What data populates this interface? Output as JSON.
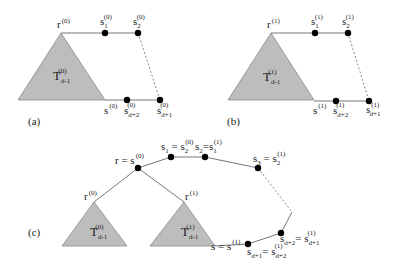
{
  "panels": {
    "a": {
      "label": "(a)",
      "root": {
        "base": "r",
        "sup": "(0)"
      },
      "tree": {
        "base": "T",
        "sup": "(0)",
        "sub": "d-1"
      },
      "s1": {
        "base": "s",
        "sub": "1",
        "sup": "(0)"
      },
      "s2": {
        "base": "s",
        "sub": "2",
        "sup": "(0)"
      },
      "s": {
        "base": "s",
        "sup": "(0)"
      },
      "sd2": {
        "base": "s",
        "sub": "d+2",
        "sup": "(0)"
      },
      "sd1": {
        "base": "s",
        "sub": "d+1",
        "sup": "(0)"
      }
    },
    "b": {
      "label": "(b)",
      "root": {
        "base": "r",
        "sup": "(1)"
      },
      "tree": {
        "base": "T",
        "sup": "(1)",
        "sub": "d-1"
      },
      "s1": {
        "base": "s",
        "sub": "1",
        "sup": "(1)"
      },
      "s2": {
        "base": "s",
        "sub": "2",
        "sup": "(1)"
      },
      "s": {
        "base": "s",
        "sup": "(1)"
      },
      "sd2": {
        "base": "s",
        "sub": "d+2",
        "sup": "(1)"
      },
      "sd1": {
        "base": "s",
        "sub": "d+1",
        "sup": "(1)"
      }
    },
    "c": {
      "label": "(c)",
      "root_eq": {
        "lhs": "r = s",
        "sup": "(0)"
      },
      "r0": {
        "base": "r",
        "sup": "(0)"
      },
      "r1": {
        "base": "r",
        "sup": "(1)"
      },
      "tree0": {
        "base": "T",
        "sup": "(0)",
        "sub": "d-1"
      },
      "tree1": {
        "base": "T",
        "sup": "(1)",
        "sub": "d-1"
      },
      "s1_eq": {
        "lhs": "s",
        "lhs_sub": "1",
        "eq": " = s",
        "rhs_sub": "2",
        "rhs_sup": "(0)"
      },
      "s2_eq": {
        "lhs": "s",
        "lhs_sub": "2",
        "eq": "=s",
        "rhs_sub": "1",
        "rhs_sup": "(1)"
      },
      "s3_eq": {
        "lhs": "s",
        "lhs_sub": "3",
        "eq": " = s",
        "rhs_sub": "2",
        "rhs_sup": "(1)"
      },
      "s_eq": {
        "lhs": "s = s",
        "sup": "(1)"
      },
      "sd1_eq": {
        "lhs": "s",
        "lhs_sub": "d+1",
        "eq": "= s",
        "rhs_sub": "d+2",
        "rhs_sup": "(1)"
      },
      "sd2_eq": {
        "lhs": "s",
        "lhs_sub": "d+2",
        "eq": "= s",
        "rhs_sub": "d+1",
        "rhs_sup": "(1)"
      }
    }
  }
}
